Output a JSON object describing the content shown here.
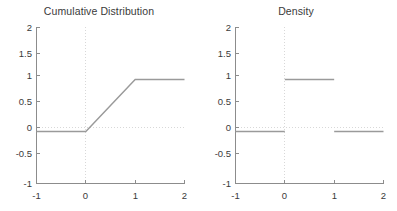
{
  "figure": {
    "background": "#ffffff",
    "line_color": "#9a9a9a",
    "axis_color": "#8c8c8c",
    "grid_color": "#d8d8d8",
    "text_color": "#3a3a3a"
  },
  "panels": [
    {
      "id": "cdf",
      "title": "Cumulative Distribution"
    },
    {
      "id": "pdf",
      "title": "Density"
    }
  ],
  "chart_data": [
    {
      "type": "line",
      "title": "Cumulative Distribution",
      "xlabel": "",
      "ylabel": "",
      "xlim": [
        -1,
        2
      ],
      "ylim": [
        -1,
        2
      ],
      "xticks": [
        -1,
        0,
        1,
        2
      ],
      "xticklabels": [
        "-1",
        "0",
        "1",
        "2"
      ],
      "yticks": [
        -1,
        -0.5,
        0,
        0.5,
        1,
        1.5,
        2
      ],
      "yticklabels": [
        "-1",
        "-0.5",
        "0",
        "0.5",
        "1",
        "1.5",
        "2"
      ],
      "grid": "dotted gridlines at x=0 and y=0",
      "legend": "none",
      "series": [
        {
          "name": "CDF of Uniform(0,1)",
          "x": [
            -1,
            0,
            1,
            2
          ],
          "values": [
            0,
            0,
            1,
            1
          ]
        }
      ]
    },
    {
      "type": "line",
      "title": "Density",
      "xlabel": "",
      "ylabel": "",
      "xlim": [
        -1,
        2
      ],
      "ylim": [
        -1,
        2
      ],
      "xticks": [
        -1,
        0,
        1,
        2
      ],
      "xticklabels": [
        "-1",
        "0",
        "1",
        "2"
      ],
      "yticks": [
        -1,
        -0.5,
        0,
        0.5,
        1,
        1.5,
        2
      ],
      "yticklabels": [
        "-1",
        "-0.5",
        "0",
        "0.5",
        "1",
        "1.5",
        "2"
      ],
      "grid": "dotted gridlines at x=0 and y=0",
      "legend": "none",
      "series": [
        {
          "name": "PDF of Uniform(0,1)",
          "segments": [
            {
              "x": [
                -1,
                0
              ],
              "values": [
                0,
                0
              ]
            },
            {
              "x": [
                0,
                1
              ],
              "values": [
                1,
                1
              ]
            },
            {
              "x": [
                1,
                2
              ],
              "values": [
                0,
                0
              ]
            }
          ]
        }
      ]
    }
  ],
  "labels": {
    "y": [
      "2",
      "1.5",
      "1",
      "0.5",
      "0",
      "-0.5",
      "-1"
    ],
    "x": [
      "-1",
      "0",
      "1",
      "2"
    ]
  }
}
